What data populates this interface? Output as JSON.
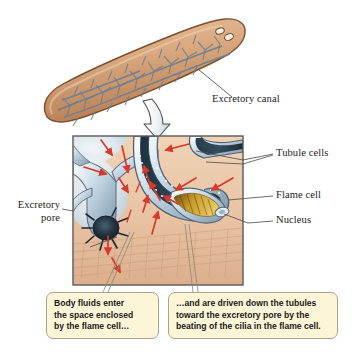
{
  "figure": {
    "background_color": "#ffffff"
  },
  "organism": {
    "name": "planarian-flatworm",
    "body_color": "#d9a87e",
    "body_shadow_color": "#8a5a38",
    "canal_color": "#6d7f92",
    "eyespot_color": "#f4efe6"
  },
  "inset": {
    "name": "magnified-detail-panel",
    "border_color": "#5a5a5a",
    "tissue_color": "#e8c3a3",
    "tubule_color": "#b9ccd8",
    "flow_arrow_color": "#d8392b",
    "pore_color": "#22303c",
    "cilia_color": "#b8860b"
  },
  "zoom_arrow": {
    "name": "magnify-pointer-arrow",
    "fill": "#eef2f5",
    "stroke": "#4a4a4a"
  },
  "labels": [
    {
      "id": "excretory-canal",
      "text": "Excretory canal",
      "align": "left"
    },
    {
      "id": "tubule-cells",
      "text": "Tubule cells",
      "align": "left"
    },
    {
      "id": "flame-cell",
      "text": "Flame cell",
      "align": "left"
    },
    {
      "id": "nucleus",
      "text": "Nucleus",
      "align": "left"
    },
    {
      "id": "excretory-pore-line1",
      "text": "Excretory",
      "align": "right"
    },
    {
      "id": "excretory-pore-line2",
      "text": "pore",
      "align": "right"
    }
  ],
  "callouts": {
    "left": {
      "id": "callout-body-fluids",
      "lines": [
        "Body fluids enter",
        "the space enclosed",
        "by the flame cell…"
      ]
    },
    "right": {
      "id": "callout-driven-down",
      "lines": [
        "…and are driven down the tubules",
        "toward the excretory pore by the",
        "beating of the cilia in the flame cell."
      ]
    }
  }
}
